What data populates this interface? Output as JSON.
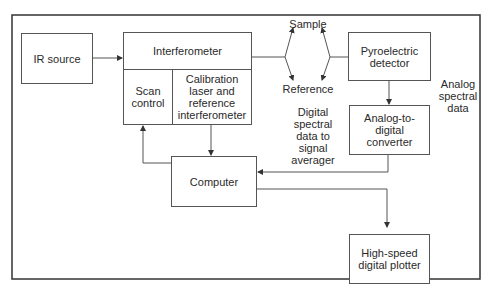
{
  "diagram": {
    "nodes": {
      "ir_source": "IR source",
      "interferometer": "Interferometer",
      "scan_control": "Scan control",
      "calibration": "Calibration laser and reference interferometer",
      "pyroelectric_detector": "Pyroelectric detector",
      "adc": "Analog-to-digital converter",
      "computer": "Computer",
      "plotter": "High-speed digital plotter"
    },
    "labels": {
      "sample": "Sample",
      "reference": "Reference",
      "analog_data": "Analog spectral data",
      "digital_data": "Digital spectral data to signal averager"
    },
    "edges": [
      {
        "from": "IR source",
        "to": "Interferometer"
      },
      {
        "from": "Interferometer",
        "to": "Sample/Reference"
      },
      {
        "from": "Sample/Reference",
        "to": "Pyroelectric detector"
      },
      {
        "from": "Pyroelectric detector",
        "to": "Analog-to-digital converter"
      },
      {
        "from": "Analog-to-digital converter",
        "to": "Computer"
      },
      {
        "from": "Calibration laser and reference interferometer",
        "to": "Computer"
      },
      {
        "from": "Computer",
        "to": "Scan control"
      },
      {
        "from": "Computer",
        "to": "High-speed digital plotter"
      }
    ]
  }
}
